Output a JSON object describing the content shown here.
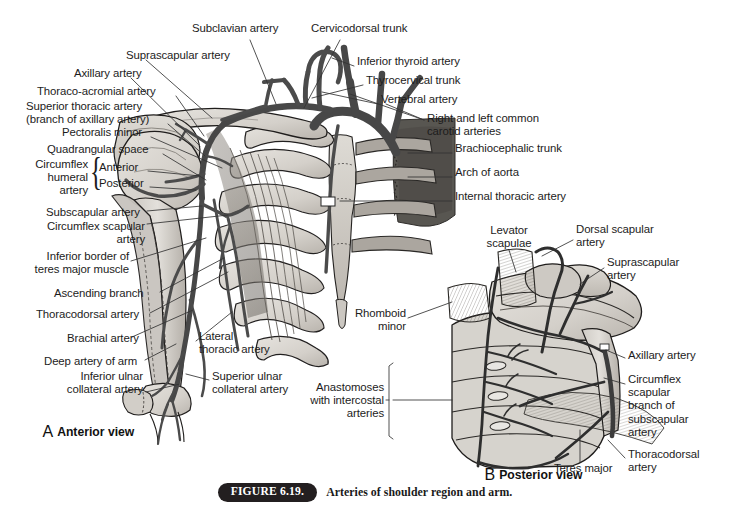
{
  "figure": {
    "badge": "FIGURE 6.19.",
    "caption": "Arteries of shoulder region and arm.",
    "background_color": "#ffffff"
  },
  "palette": {
    "artery": "#4f4f4f",
    "artery_dark": "#3a3a3a",
    "bone_light": "#d9d6d0",
    "bone_mid": "#c3bfb8",
    "bone_shadow": "#a7a29a",
    "muscle": "#8e8a84",
    "outline": "#1c1c1c",
    "aorta_dark": "#585858",
    "label_text": "#1c1c1c"
  },
  "panels": [
    {
      "id": "A",
      "letter": "A",
      "view_label": "Anterior view",
      "label_x": 28,
      "label_y": 412
    },
    {
      "id": "B",
      "letter": "B",
      "view_label": "Posterior view",
      "label_x": 470,
      "label_y": 455
    }
  ],
  "labels_panel_a": [
    {
      "name": "subclavian-artery",
      "text": "Subclavian artery",
      "x": 192,
      "y": 28,
      "align": "l",
      "lines": 1
    },
    {
      "name": "cervicodorsal-trunk",
      "text": "Cervicodorsal trunk",
      "x": 311,
      "y": 28,
      "align": "l",
      "lines": 1
    },
    {
      "name": "suprascapular-artery",
      "text": "Suprascapular artery",
      "x": 126,
      "y": 55,
      "align": "l",
      "lines": 1
    },
    {
      "name": "inferior-thyroid-artery",
      "text": "Inferior thyroid artery",
      "x": 357,
      "y": 60,
      "align": "l",
      "lines": 1
    },
    {
      "name": "axillary-artery",
      "text": "Axillary artery",
      "x": 74,
      "y": 72,
      "align": "l",
      "lines": 1
    },
    {
      "name": "thyrocervical-trunk",
      "text": "Thyrocervical trunk",
      "x": 366,
      "y": 79,
      "align": "l",
      "lines": 1
    },
    {
      "name": "thoraco-acromial-artery",
      "text": "Thoraco-acromial artery",
      "x": 37,
      "y": 90,
      "align": "l",
      "lines": 1
    },
    {
      "name": "vertebral-artery",
      "text": "Vertebral artery",
      "x": 381,
      "y": 98,
      "align": "l",
      "lines": 1
    },
    {
      "name": "superior-thoracic-artery",
      "text": "Superior thoracic artery\n(branch of axillary artery)",
      "x": 26,
      "y": 105,
      "align": "l",
      "lines": 2
    },
    {
      "name": "common-carotid-arteries",
      "text": "Right and left common\ncarotid arteries",
      "x": 427,
      "y": 117,
      "align": "l",
      "lines": 2
    },
    {
      "name": "pectoralis-minor",
      "text": "Pectoralis minor",
      "x": 62,
      "y": 131,
      "align": "l",
      "lines": 1
    },
    {
      "name": "brachiocephalic-trunk",
      "text": "Brachiocephalic trunk",
      "x": 455,
      "y": 147,
      "align": "l",
      "lines": 1
    },
    {
      "name": "quadrangular-space",
      "text": "Quadrangular space",
      "x": 47,
      "y": 148,
      "align": "l",
      "lines": 1
    },
    {
      "name": "circumflex-humeral-artery",
      "text": "Circumflex\nhumeral\nartery",
      "x": 25,
      "y": 162,
      "align": "r",
      "lines": 3
    },
    {
      "name": "circumflex-humeral-anterior",
      "text": "Anterior",
      "x": 99,
      "y": 166,
      "align": "l",
      "lines": 1
    },
    {
      "name": "circumflex-humeral-posterior",
      "text": "Posterior",
      "x": 99,
      "y": 182,
      "align": "l",
      "lines": 1
    },
    {
      "name": "arch-of-aorta",
      "text": "Arch of aorta",
      "x": 455,
      "y": 171,
      "align": "l",
      "lines": 1
    },
    {
      "name": "internal-thoracic-artery",
      "text": "Internal thoracic artery",
      "x": 455,
      "y": 195,
      "align": "l",
      "lines": 1
    },
    {
      "name": "subscapular-artery",
      "text": "Subscapular artery",
      "x": 46,
      "y": 205,
      "align": "l",
      "lines": 1
    },
    {
      "name": "circumflex-scapular-artery",
      "text": "Circumflex scapular\nartery",
      "x": 45,
      "y": 225,
      "align": "r",
      "lines": 2
    },
    {
      "name": "inferior-border-teres-major",
      "text": "Inferior border of\nteres major muscle",
      "x": 29,
      "y": 255,
      "align": "r",
      "lines": 2
    },
    {
      "name": "ascending-branch",
      "text": "Ascending branch",
      "x": 54,
      "y": 286,
      "align": "l",
      "lines": 1
    },
    {
      "name": "thoracodorsal-artery-a",
      "text": "Thoracodorsal artery",
      "x": 36,
      "y": 307,
      "align": "l",
      "lines": 1
    },
    {
      "name": "lateral-thoracic-artery",
      "text": "Lateral\nthoracic artery",
      "x": 199,
      "y": 335,
      "align": "l",
      "lines": 2
    },
    {
      "name": "brachial-artery",
      "text": "Brachial artery",
      "x": 67,
      "y": 331,
      "align": "l",
      "lines": 1
    },
    {
      "name": "deep-artery-of-arm",
      "text": "Deep artery of arm",
      "x": 44,
      "y": 354,
      "align": "l",
      "lines": 1
    },
    {
      "name": "superior-ulnar-collateral-artery",
      "text": "Superior ulnar\ncollateral artery",
      "x": 212,
      "y": 374,
      "align": "l",
      "lines": 2
    },
    {
      "name": "inferior-ulnar-collateral-artery",
      "text": "Inferior ulnar\ncollateral artery",
      "x": 46,
      "y": 374,
      "align": "r",
      "lines": 2
    }
  ],
  "labels_panel_b": [
    {
      "name": "levator-scapulae",
      "text": "Levator\nscapulae",
      "x": 470,
      "y": 228,
      "align": "c",
      "lines": 2
    },
    {
      "name": "dorsal-scapular-artery",
      "text": "Dorsal scapular\nartery",
      "x": 576,
      "y": 226,
      "align": "l",
      "lines": 2
    },
    {
      "name": "suprascapular-artery-b",
      "text": "Suprascapular\nartery",
      "x": 607,
      "y": 260,
      "align": "l",
      "lines": 2
    },
    {
      "name": "rhomboid-minor",
      "text": "Rhomboid\nminor",
      "x": 405,
      "y": 311,
      "align": "r",
      "lines": 2
    },
    {
      "name": "axillary-artery-b",
      "text": "Axillary artery",
      "x": 628,
      "y": 353,
      "align": "l",
      "lines": 1
    },
    {
      "name": "circumflex-scapular-branch",
      "text": "Circumflex\nscapular\nbranch of\nsubscapular\nartery",
      "x": 628,
      "y": 378,
      "align": "l",
      "lines": 5
    },
    {
      "name": "anastomoses-intercostal",
      "text": "Anastomoses\nwith intercostal\narteries",
      "x": 384,
      "y": 385,
      "align": "r",
      "lines": 3
    },
    {
      "name": "thoracodorsal-artery-b",
      "text": "Thoracodorsal\nartery",
      "x": 628,
      "y": 452,
      "align": "l",
      "lines": 2
    },
    {
      "name": "teres-major",
      "text": "Teres major",
      "x": 554,
      "y": 466,
      "align": "l",
      "lines": 1
    }
  ]
}
